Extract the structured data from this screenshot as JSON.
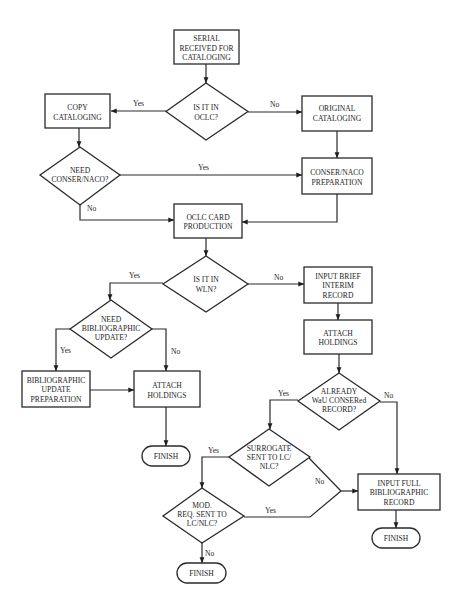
{
  "diagram": {
    "type": "flowchart",
    "nodes": {
      "serial_received": {
        "shape": "process",
        "lines": [
          "SERIAL",
          "RECEIVED FOR",
          "CATALOGING"
        ]
      },
      "is_in_oclc": {
        "shape": "decision",
        "lines": [
          "IS IT IN",
          "OCLC?"
        ]
      },
      "copy_cataloging": {
        "shape": "process",
        "lines": [
          "COPY",
          "CATALOGING"
        ]
      },
      "original_cataloging": {
        "shape": "process",
        "lines": [
          "ORIGINAL",
          "CATALOGING"
        ]
      },
      "need_conser_naco": {
        "shape": "decision",
        "lines": [
          "NEED",
          "CONSER/NACO?"
        ]
      },
      "conser_naco_prep": {
        "shape": "process",
        "lines": [
          "CONSER/NACO",
          "PREPARATION"
        ]
      },
      "oclc_card_production": {
        "shape": "process",
        "lines": [
          "OCLC CARD",
          "PRODUCTION"
        ]
      },
      "is_in_wln": {
        "shape": "decision",
        "lines": [
          "IS IT IN",
          "WLN?"
        ]
      },
      "input_brief_interim": {
        "shape": "process",
        "lines": [
          "INPUT BRIEF",
          "INTERIM",
          "RECORD"
        ]
      },
      "need_biblio_update": {
        "shape": "decision",
        "lines": [
          "NEED",
          "BIBLIOGRAPHIC",
          "UPDATE?"
        ]
      },
      "attach_holdings_right": {
        "shape": "process",
        "lines": [
          "ATTACH",
          "HOLDINGS"
        ]
      },
      "biblio_update_prep": {
        "shape": "process",
        "lines": [
          "BIBLIOGRAPHIC",
          "UPDATE",
          "PREPARATION"
        ]
      },
      "attach_holdings_left": {
        "shape": "process",
        "lines": [
          "ATTACH",
          "HOLDINGS"
        ]
      },
      "already_conser_record": {
        "shape": "decision",
        "lines": [
          "ALREADY",
          "WaU CONSERed",
          "RECORD?"
        ]
      },
      "finish_left": {
        "shape": "terminal",
        "lines": [
          "FINISH"
        ]
      },
      "surrogate_sent": {
        "shape": "decision",
        "lines": [
          "SURROGATE",
          "SENT TO LC/",
          "NLC?"
        ]
      },
      "input_full_record": {
        "shape": "process",
        "lines": [
          "INPUT FULL",
          "BIBLIOGRAPHIC",
          "RECORD"
        ]
      },
      "mod_req_sent": {
        "shape": "decision",
        "lines": [
          "MOD.",
          "REQ. SENT TO",
          "LC/NLC?"
        ]
      },
      "finish_right": {
        "shape": "terminal",
        "lines": [
          "FINISH"
        ]
      },
      "finish_bottom": {
        "shape": "terminal",
        "lines": [
          "FINISH"
        ]
      }
    },
    "edges": [
      {
        "from": "serial_received",
        "to": "is_in_oclc",
        "label": ""
      },
      {
        "from": "is_in_oclc",
        "to": "copy_cataloging",
        "label": "Yes"
      },
      {
        "from": "is_in_oclc",
        "to": "original_cataloging",
        "label": "No"
      },
      {
        "from": "copy_cataloging",
        "to": "need_conser_naco",
        "label": ""
      },
      {
        "from": "need_conser_naco",
        "to": "conser_naco_prep",
        "label": "Yes"
      },
      {
        "from": "need_conser_naco",
        "to": "oclc_card_production",
        "label": "No"
      },
      {
        "from": "original_cataloging",
        "to": "conser_naco_prep",
        "label": ""
      },
      {
        "from": "conser_naco_prep",
        "to": "oclc_card_production",
        "label": ""
      },
      {
        "from": "oclc_card_production",
        "to": "is_in_wln",
        "label": ""
      },
      {
        "from": "is_in_wln",
        "to": "need_biblio_update",
        "label": "Yes"
      },
      {
        "from": "is_in_wln",
        "to": "input_brief_interim",
        "label": "No"
      },
      {
        "from": "need_biblio_update",
        "to": "biblio_update_prep",
        "label": "Yes"
      },
      {
        "from": "need_biblio_update",
        "to": "attach_holdings_left",
        "label": "No"
      },
      {
        "from": "biblio_update_prep",
        "to": "attach_holdings_left",
        "label": ""
      },
      {
        "from": "attach_holdings_left",
        "to": "finish_left",
        "label": ""
      },
      {
        "from": "input_brief_interim",
        "to": "attach_holdings_right",
        "label": ""
      },
      {
        "from": "attach_holdings_right",
        "to": "already_conser_record",
        "label": ""
      },
      {
        "from": "already_conser_record",
        "to": "surrogate_sent",
        "label": "Yes"
      },
      {
        "from": "already_conser_record",
        "to": "input_full_record",
        "label": "No"
      },
      {
        "from": "surrogate_sent",
        "to": "mod_req_sent",
        "label": "Yes"
      },
      {
        "from": "surrogate_sent",
        "to": "input_full_record",
        "label": "No"
      },
      {
        "from": "mod_req_sent",
        "to": "input_full_record",
        "label": "Yes"
      },
      {
        "from": "mod_req_sent",
        "to": "finish_bottom",
        "label": "No"
      },
      {
        "from": "input_full_record",
        "to": "finish_right",
        "label": ""
      }
    ],
    "edge_labels": {
      "oclc_yes": "Yes",
      "oclc_no": "No",
      "conser_yes": "Yes",
      "conser_no": "No",
      "wln_yes": "Yes",
      "wln_no": "No",
      "biblio_yes": "Yes",
      "biblio_no": "No",
      "already_yes": "Yes",
      "already_no": "No",
      "surrogate_yes": "Yes",
      "surrogate_no": "No",
      "mod_yes": "Yes",
      "mod_no": "No"
    }
  }
}
